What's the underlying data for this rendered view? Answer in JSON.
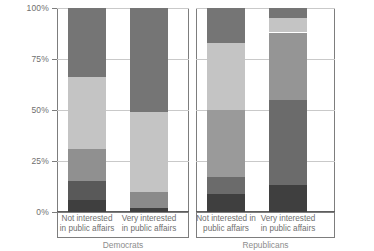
{
  "chart_data": {
    "type": "bar",
    "subtype": "stacked-100-percent",
    "title": "",
    "xlabel": "",
    "ylabel": "",
    "ylim": [
      0,
      100
    ],
    "ytick_labels": [
      "0%",
      "25%",
      "50%",
      "75%",
      "100%"
    ],
    "ytick_values": [
      0,
      25,
      50,
      75,
      100
    ],
    "grid": true,
    "legend": "none",
    "panels": [
      {
        "label": "Democrats",
        "categories": [
          "Not interested\nin public affairs",
          "Very interested\nin public affairs"
        ],
        "bars": [
          {
            "category": "Not interested in public affairs",
            "segments": [
              {
                "name": "segment-1",
                "value": 6,
                "color": "#3f3f3f"
              },
              {
                "name": "segment-2",
                "value": 9,
                "color": "#595959"
              },
              {
                "name": "segment-3",
                "value": 16,
                "color": "#909090"
              },
              {
                "name": "segment-4",
                "value": 35,
                "color": "#c4c4c4"
              },
              {
                "name": "segment-5",
                "value": 34,
                "color": "#757575"
              }
            ]
          },
          {
            "category": "Very interested in public affairs",
            "segments": [
              {
                "name": "segment-1",
                "value": 2,
                "color": "#3f3f3f"
              },
              {
                "name": "segment-2",
                "value": 8,
                "color": "#8a8a8a"
              },
              {
                "name": "segment-3",
                "value": 39,
                "color": "#c4c4c4"
              },
              {
                "name": "segment-4",
                "value": 51,
                "color": "#757575"
              },
              {
                "name": "segment-5",
                "value": 0,
                "color": "#3f3f3f"
              }
            ]
          }
        ]
      },
      {
        "label": "Republicans",
        "categories": [
          "Not interested in\npublic affairs",
          "Very interested\nin public affairs"
        ],
        "bars": [
          {
            "category": "Not interested in public affairs",
            "segments": [
              {
                "name": "segment-1",
                "value": 9,
                "color": "#3f3f3f"
              },
              {
                "name": "segment-2",
                "value": 8,
                "color": "#6b6b6b"
              },
              {
                "name": "segment-3",
                "value": 33,
                "color": "#9a9a9a"
              },
              {
                "name": "segment-4",
                "value": 33,
                "color": "#c4c4c4"
              },
              {
                "name": "segment-5",
                "value": 17,
                "color": "#757575"
              }
            ]
          },
          {
            "category": "Very interested in public affairs",
            "segments": [
              {
                "name": "segment-1",
                "value": 13,
                "color": "#3f3f3f"
              },
              {
                "name": "segment-2",
                "value": 42,
                "color": "#6b6b6b"
              },
              {
                "name": "segment-3",
                "value": 33,
                "color": "#959595"
              },
              {
                "name": "segment-4",
                "value": 7,
                "color": "#c4c4c4"
              },
              {
                "name": "segment-5",
                "value": 5,
                "color": "#757575"
              }
            ]
          }
        ]
      }
    ]
  }
}
